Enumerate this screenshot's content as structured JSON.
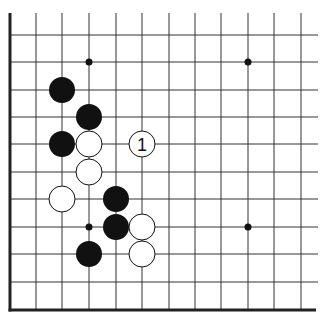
{
  "diagram": {
    "type": "go-board-fragment",
    "colors": {
      "background": "#ffffff",
      "line": "#333333",
      "edge": "#222222",
      "black_stone": "#111111",
      "white_stone": "#ffffff"
    },
    "grid": {
      "x_lines": [
        36,
        62,
        89,
        116,
        142,
        169,
        195,
        221,
        248,
        274,
        301
      ],
      "y_lines": [
        35,
        62,
        90,
        117,
        144,
        172,
        199,
        227,
        254,
        282
      ],
      "left_edge_x": 10,
      "bottom_edge_y": 310,
      "top_open_y": 13,
      "right_open_x": 318
    },
    "star_points": [
      {
        "x": 89,
        "y": 62
      },
      {
        "x": 248,
        "y": 62
      },
      {
        "x": 89,
        "y": 227
      },
      {
        "x": 248,
        "y": 227
      }
    ],
    "stones": [
      {
        "color": "black",
        "x": 62,
        "y": 90,
        "label": ""
      },
      {
        "color": "black",
        "x": 89,
        "y": 117,
        "label": ""
      },
      {
        "color": "black",
        "x": 62,
        "y": 144,
        "label": ""
      },
      {
        "color": "white",
        "x": 89,
        "y": 144,
        "label": ""
      },
      {
        "color": "white",
        "x": 142,
        "y": 144,
        "label": "1"
      },
      {
        "color": "white",
        "x": 89,
        "y": 172,
        "label": ""
      },
      {
        "color": "white",
        "x": 62,
        "y": 199,
        "label": ""
      },
      {
        "color": "black",
        "x": 116,
        "y": 199,
        "label": ""
      },
      {
        "color": "black",
        "x": 116,
        "y": 227,
        "label": ""
      },
      {
        "color": "white",
        "x": 142,
        "y": 227,
        "label": ""
      },
      {
        "color": "black",
        "x": 89,
        "y": 254,
        "label": ""
      },
      {
        "color": "white",
        "x": 142,
        "y": 254,
        "label": ""
      }
    ],
    "move_labels": [
      {
        "text": "1",
        "x": 142,
        "y": 144
      }
    ]
  }
}
